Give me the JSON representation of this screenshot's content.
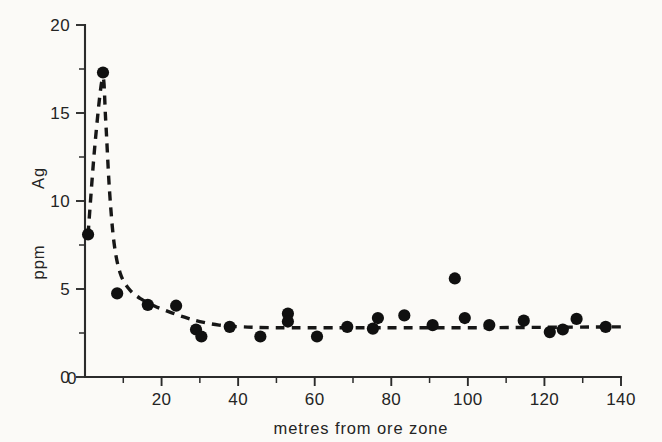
{
  "figure": {
    "background_color": "#fbfaf7",
    "ink_color": "#171717"
  },
  "chart_data": {
    "type": "scatter",
    "title": "",
    "subtitle": "",
    "xlabel": "metres  from  ore  zone",
    "ylabel": "Ag   ppm",
    "ylabel_parts": [
      "Ag",
      "ppm"
    ],
    "xlim": [
      0,
      140
    ],
    "ylim": [
      0,
      20
    ],
    "grid": false,
    "legend": null,
    "x_ticks": [
      0,
      20,
      40,
      60,
      80,
      100,
      120,
      140
    ],
    "x_tick_labels": [
      "0",
      "20",
      "40",
      "60",
      "80",
      "100",
      "120",
      "140"
    ],
    "x_minor_ticks": [
      10,
      30,
      50,
      70,
      90,
      110,
      130
    ],
    "y_ticks": [
      0,
      5,
      10,
      15,
      20
    ],
    "y_tick_labels": [
      "0",
      "5",
      "10",
      "15",
      "20"
    ],
    "y_minor_ticks": [
      2.5,
      7.5,
      12.5,
      17.5
    ],
    "marker": "filled-circle",
    "marker_color": "#101010",
    "points": [
      {
        "x": 0.8,
        "y": 8.1
      },
      {
        "x": 4.7,
        "y": 17.3
      },
      {
        "x": 8.4,
        "y": 4.75
      },
      {
        "x": 16.4,
        "y": 4.1
      },
      {
        "x": 23.8,
        "y": 4.05
      },
      {
        "x": 29.0,
        "y": 2.7
      },
      {
        "x": 30.4,
        "y": 2.3
      },
      {
        "x": 37.8,
        "y": 2.85
      },
      {
        "x": 45.8,
        "y": 2.3
      },
      {
        "x": 53.0,
        "y": 3.6
      },
      {
        "x": 53.0,
        "y": 3.15
      },
      {
        "x": 60.6,
        "y": 2.3
      },
      {
        "x": 68.5,
        "y": 2.85
      },
      {
        "x": 75.2,
        "y": 2.75
      },
      {
        "x": 76.5,
        "y": 3.35
      },
      {
        "x": 83.4,
        "y": 3.5
      },
      {
        "x": 90.8,
        "y": 2.95
      },
      {
        "x": 96.6,
        "y": 5.6
      },
      {
        "x": 99.2,
        "y": 3.35
      },
      {
        "x": 105.6,
        "y": 2.95
      },
      {
        "x": 114.6,
        "y": 3.2
      },
      {
        "x": 121.4,
        "y": 2.55
      },
      {
        "x": 124.8,
        "y": 2.7
      },
      {
        "x": 128.4,
        "y": 3.3
      },
      {
        "x": 136.0,
        "y": 2.85
      }
    ],
    "fit_curve": {
      "style": "dashed",
      "description": "steep decay from peak to asymptote",
      "asymptote_y": 2.8,
      "path_points": [
        {
          "x": 0.8,
          "y": 8.1
        },
        {
          "x": 2.6,
          "y": 13.2
        },
        {
          "x": 4.6,
          "y": 17.0
        },
        {
          "x": 5.4,
          "y": 14.6
        },
        {
          "x": 6.4,
          "y": 10.6
        },
        {
          "x": 7.6,
          "y": 7.6
        },
        {
          "x": 9.2,
          "y": 5.9
        },
        {
          "x": 11.5,
          "y": 5.0
        },
        {
          "x": 14.5,
          "y": 4.45
        },
        {
          "x": 18.0,
          "y": 4.05
        },
        {
          "x": 22.0,
          "y": 3.7
        },
        {
          "x": 26.0,
          "y": 3.4
        },
        {
          "x": 30.0,
          "y": 3.15
        },
        {
          "x": 35.0,
          "y": 2.95
        },
        {
          "x": 41.0,
          "y": 2.85
        },
        {
          "x": 50.0,
          "y": 2.8
        },
        {
          "x": 70.0,
          "y": 2.8
        },
        {
          "x": 100.0,
          "y": 2.8
        },
        {
          "x": 140.0,
          "y": 2.85
        }
      ]
    }
  }
}
